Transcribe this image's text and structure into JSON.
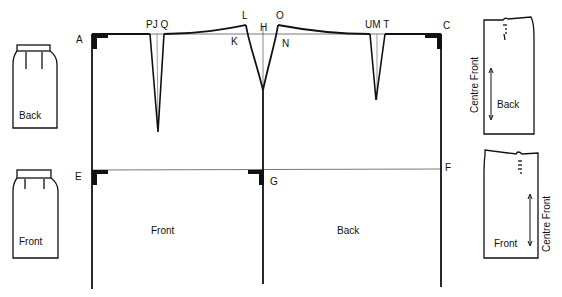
{
  "diagram": {
    "points": {
      "A": "A",
      "PJQ": "PJ Q",
      "L": "L",
      "H": "H",
      "O": "O",
      "K": "K",
      "N": "N",
      "UMT": "UM T",
      "C": "C",
      "E": "E",
      "G": "G",
      "F": "F"
    },
    "panels": {
      "front": "Front",
      "back": "Back"
    },
    "thumbnails": {
      "back_skirt": "Back",
      "front_skirt": "Front"
    },
    "pattern_pieces": {
      "back_piece": {
        "label": "Back",
        "side_label": "Centre Front"
      },
      "front_piece": {
        "label": "Front",
        "side_label": "Centre Front"
      }
    },
    "colors": {
      "line": "#111111",
      "guide": "#555555",
      "background": "#ffffff"
    }
  }
}
